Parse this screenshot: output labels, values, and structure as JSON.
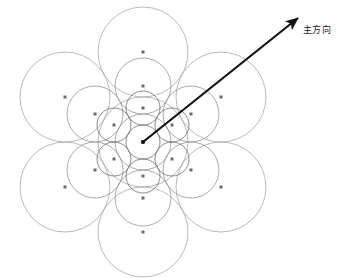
{
  "figure": {
    "caption": "图 5  层次圆形排布",
    "caption_visible": "partially-cropped"
  },
  "annotations": {
    "direction_label": "主方向"
  },
  "colors": {
    "circle_stroke_level1": "#a8a8a8",
    "circle_stroke_level2": "#8f8f8f",
    "circle_stroke_level3": "#6f6f6f",
    "center_dot": "#6b6b6b",
    "arrow": "#111111",
    "background": "#ffffff",
    "caption_text": "#c9c9c9",
    "label_text": "#1a1a1a"
  },
  "chart_data": {
    "type": "scatter",
    "title": "图 5  层次圆形排布",
    "xlabel": "",
    "ylabel": "",
    "xlim": [
      0,
      342
    ],
    "ylim": [
      0,
      278
    ],
    "grid": false,
    "legend": "none",
    "center": {
      "x": 143,
      "y": 142
    },
    "levels": [
      {
        "name": "level-1-outer",
        "radius": 45,
        "ring_distance": 90,
        "ring_count": 6,
        "stroke": "#a8a8a8",
        "stroke_width": 0.8,
        "circles": [
          {
            "cx": 143,
            "cy": 142,
            "r": 45
          },
          {
            "cx": 143,
            "cy": 52,
            "r": 45
          },
          {
            "cx": 221,
            "cy": 97,
            "r": 45
          },
          {
            "cx": 221,
            "cy": 187,
            "r": 45
          },
          {
            "cx": 143,
            "cy": 232,
            "r": 45
          },
          {
            "cx": 65,
            "cy": 187,
            "r": 45
          },
          {
            "cx": 65,
            "cy": 97,
            "r": 45
          }
        ],
        "dots": [
          {
            "x": 143,
            "y": 52
          },
          {
            "x": 221,
            "y": 97
          },
          {
            "x": 221,
            "y": 187
          },
          {
            "x": 143,
            "y": 232
          },
          {
            "x": 65,
            "y": 187
          },
          {
            "x": 65,
            "y": 97
          }
        ]
      },
      {
        "name": "level-2-middle",
        "radius": 28,
        "ring_distance": 56,
        "ring_count": 6,
        "stroke": "#949494",
        "stroke_width": 0.8,
        "circles": [
          {
            "cx": 143,
            "cy": 142,
            "r": 28
          },
          {
            "cx": 143,
            "cy": 86,
            "r": 28
          },
          {
            "cx": 191,
            "cy": 114,
            "r": 28
          },
          {
            "cx": 191,
            "cy": 170,
            "r": 28
          },
          {
            "cx": 143,
            "cy": 198,
            "r": 28
          },
          {
            "cx": 95,
            "cy": 170,
            "r": 28
          },
          {
            "cx": 95,
            "cy": 114,
            "r": 28
          }
        ],
        "dots": [
          {
            "x": 143,
            "y": 86
          },
          {
            "x": 191,
            "y": 114
          },
          {
            "x": 191,
            "y": 170
          },
          {
            "x": 143,
            "y": 198
          },
          {
            "x": 95,
            "y": 170
          },
          {
            "x": 95,
            "y": 114
          }
        ]
      },
      {
        "name": "level-3-inner",
        "radius": 17,
        "ring_distance": 34,
        "ring_count": 6,
        "stroke": "#6f6f6f",
        "stroke_width": 0.8,
        "circles": [
          {
            "cx": 143,
            "cy": 142,
            "r": 17
          },
          {
            "cx": 143,
            "cy": 108,
            "r": 17
          },
          {
            "cx": 172,
            "cy": 125,
            "r": 17
          },
          {
            "cx": 172,
            "cy": 159,
            "r": 17
          },
          {
            "cx": 143,
            "cy": 176,
            "r": 17
          },
          {
            "cx": 114,
            "cy": 159,
            "r": 17
          },
          {
            "cx": 114,
            "cy": 125,
            "r": 17
          }
        ],
        "dots": [
          {
            "x": 143,
            "y": 108
          },
          {
            "x": 172,
            "y": 125
          },
          {
            "x": 172,
            "y": 159
          },
          {
            "x": 143,
            "y": 176
          },
          {
            "x": 114,
            "y": 159
          },
          {
            "x": 114,
            "y": 125
          },
          {
            "x": 143,
            "y": 142
          }
        ]
      }
    ],
    "arrow": {
      "label": "主方向",
      "from": {
        "x": 143,
        "y": 142
      },
      "to": {
        "x": 298,
        "y": 18
      },
      "color": "#111111",
      "width": 2.2,
      "angle_deg": 38.7
    }
  }
}
